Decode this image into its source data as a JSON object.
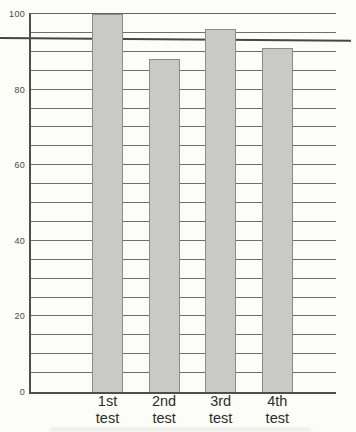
{
  "chart_data": {
    "type": "bar",
    "title": "",
    "xlabel": "",
    "ylabel": "",
    "categories": [
      {
        "line1": "1st",
        "line2": "test"
      },
      {
        "line1": "2nd",
        "line2": "test"
      },
      {
        "line1": "3rd",
        "line2": "test"
      },
      {
        "line1": "4th",
        "line2": "test"
      }
    ],
    "values": [
      100,
      88,
      96,
      91
    ],
    "ylim": [
      0,
      100
    ],
    "ytick_values": [
      0,
      20,
      40,
      60,
      80,
      100
    ],
    "ytick_labels": [
      "0",
      "20",
      "40",
      "60",
      "80",
      "100"
    ],
    "gridline_step": 5,
    "grid": "horizontal",
    "legend": "none",
    "reference_line": {
      "value": 94,
      "extends_full_image_width": true
    },
    "colors": {
      "background": "#fcfcf9",
      "bar_fill": "#c9c9c6",
      "bar_border": "#8a8a88",
      "gridline": "#6e6e6a",
      "axis": "#4e4e4c",
      "reference_line": "#464646",
      "tick_label": "#4a4a48",
      "category_label": "#2c2c2a"
    }
  }
}
